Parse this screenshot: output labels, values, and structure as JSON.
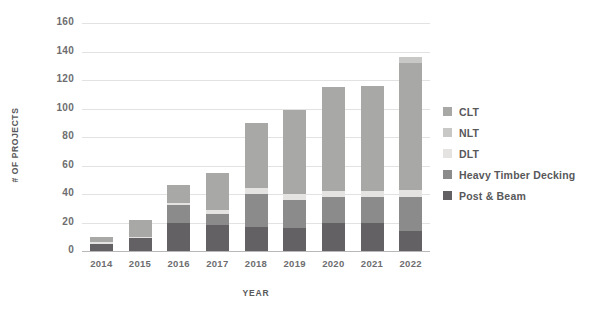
{
  "chart_data": {
    "type": "bar",
    "stacked": true,
    "title": "",
    "xlabel": "YEAR",
    "ylabel": "# OF PROJECTS",
    "categories": [
      "2014",
      "2015",
      "2016",
      "2017",
      "2018",
      "2019",
      "2020",
      "2021",
      "2022"
    ],
    "ylim": [
      0,
      160
    ],
    "yticks": [
      0,
      20,
      40,
      60,
      80,
      100,
      120,
      140,
      160
    ],
    "grid": true,
    "legend_position": "right",
    "series": [
      {
        "name": "Post & Beam",
        "color": "#636163",
        "values": [
          5,
          9,
          20,
          18,
          17,
          16,
          20,
          20,
          14
        ]
      },
      {
        "name": "Heavy Timber Decking",
        "color": "#8b8b8b",
        "values": [
          0,
          0,
          12,
          8,
          23,
          20,
          18,
          18,
          24
        ]
      },
      {
        "name": "DLT",
        "color": "#e4e3e1",
        "values": [
          1,
          1,
          2,
          3,
          4,
          4,
          4,
          4,
          5
        ]
      },
      {
        "name": "NLT",
        "color": "#c8c8c6",
        "values": [
          0,
          0,
          0,
          0,
          0,
          0,
          0,
          0,
          4
        ]
      },
      {
        "name": "CLT",
        "color": "#a8a8a6",
        "values": [
          4,
          12,
          12,
          26,
          46,
          59,
          73,
          74,
          89
        ]
      }
    ],
    "stack_order": [
      "Post & Beam",
      "Heavy Timber Decking",
      "DLT",
      "CLT",
      "NLT"
    ],
    "totals": [
      10,
      22,
      46,
      55,
      90,
      99,
      115,
      116,
      136
    ]
  },
  "legend": {
    "items": [
      {
        "label": "CLT",
        "color": "#a8a8a6"
      },
      {
        "label": "NLT",
        "color": "#c8c8c6"
      },
      {
        "label": "DLT",
        "color": "#e4e3e1"
      },
      {
        "label": "Heavy Timber Decking",
        "color": "#8b8b8b"
      },
      {
        "label": "Post & Beam",
        "color": "#636163"
      }
    ]
  },
  "colors": {
    "gridline": "#e3e2e2",
    "baseline": "#b9b8b8",
    "tick_text": "#6d6d6f",
    "axis_title_text": "#58585a",
    "background": "#ffffff"
  }
}
